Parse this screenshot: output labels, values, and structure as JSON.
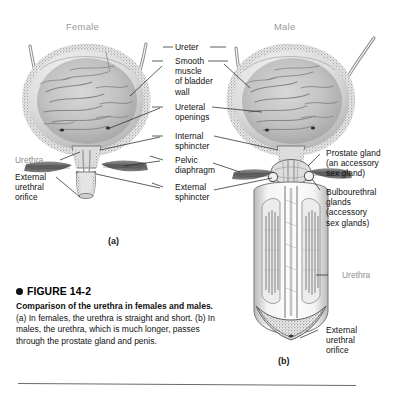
{
  "figure": {
    "number": "FIGURE 14-2",
    "title": "Comparison of the urethra in females and males.",
    "body_a": "(a) In females, the urethra is straight and short.",
    "body_b": "(b) In males, the urethra, which is much longer, passes through the prostate gland and penis."
  },
  "panels": {
    "female": {
      "heading": "Female",
      "id": "(a)"
    },
    "male": {
      "heading": "Male",
      "id": "(b)"
    }
  },
  "labels": {
    "ureter": "Ureter",
    "smooth_muscle": "Smooth\nmuscle\nof bladder\nwall",
    "ureteral_openings": "Ureteral\nopenings",
    "internal_sphincter": "Internal\nsphincter",
    "pelvic_diaphragm": "Pelvic\ndiaphragm",
    "external_sphincter": "External\nsphincter",
    "urethra_female": "Urethra",
    "external_orifice_female": "External\nurethral\norifice",
    "prostate": "Prostate gland\n(an accessory\nsex gland)",
    "bulbourethral": "Bulbourethral\nglands\n(accessory\nsex glands)",
    "urethra_male": "Urethra",
    "external_orifice_male": "External\nurethral\norifice"
  },
  "colors": {
    "background": "#ffffff",
    "label_black": "#111111",
    "label_gray": "#8d8d8d",
    "heading_gray": "#9a9a9a",
    "ink": "#5a5a5a",
    "rule": "#6a6a6a"
  }
}
